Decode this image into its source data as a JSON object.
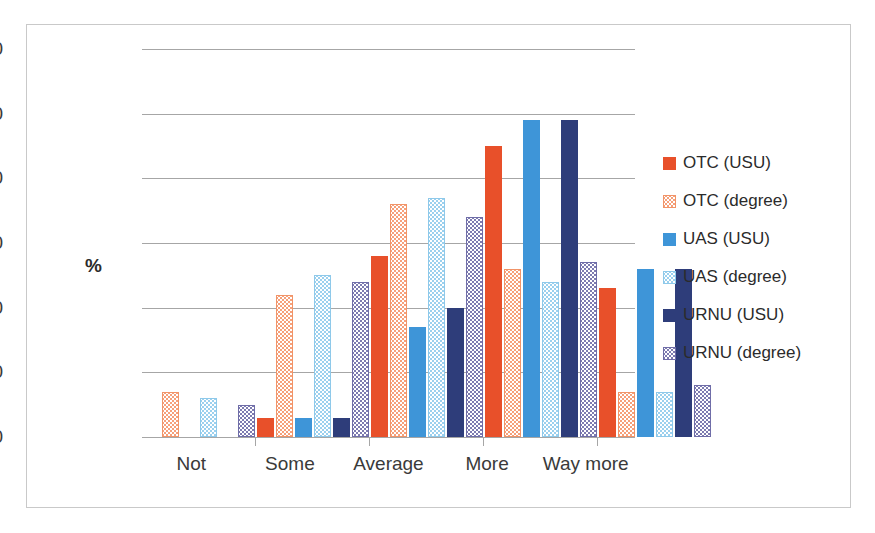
{
  "chart_data": {
    "type": "bar",
    "title": "",
    "subtitle": "",
    "xlabel": "",
    "ylabel": "%",
    "ylim": [
      0,
      60
    ],
    "yticks": [
      0,
      10,
      20,
      30,
      40,
      50,
      60
    ],
    "ytick_labels": [
      "0",
      "10",
      "20",
      "30",
      "40",
      "50",
      "60"
    ],
    "grid": true,
    "legend_position": "right",
    "categories": [
      "Not",
      "Some",
      "Average",
      "More",
      "Way more"
    ],
    "series": [
      {
        "name": "OTC (USU)",
        "color": "#E8502A",
        "pattern": "solid",
        "values": [
          0,
          3,
          28,
          45,
          23
        ]
      },
      {
        "name": "OTC (degree)",
        "color": "#F6A07A",
        "pattern": "checkered",
        "values": [
          7,
          22,
          36,
          26,
          7
        ]
      },
      {
        "name": "UAS (USU)",
        "color": "#3E95D8",
        "pattern": "solid",
        "values": [
          0,
          3,
          17,
          49,
          26
        ]
      },
      {
        "name": "UAS (degree)",
        "color": "#9BD0EE",
        "pattern": "checkered",
        "values": [
          6,
          25,
          37,
          24,
          7
        ]
      },
      {
        "name": "URNU (USU)",
        "color": "#2E3D7A",
        "pattern": "solid",
        "values": [
          0,
          3,
          20,
          49,
          26
        ]
      },
      {
        "name": "URNU (degree)",
        "color": "#7D7BB0",
        "pattern": "checkered",
        "values": [
          5,
          24,
          34,
          27,
          8
        ]
      }
    ]
  }
}
